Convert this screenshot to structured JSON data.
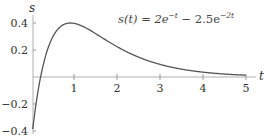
{
  "chart_data": {
    "type": "line",
    "xlabel": "t",
    "ylabel": "s",
    "xlim": [
      0,
      5.4
    ],
    "ylim": [
      -0.42,
      0.45
    ],
    "grid": false,
    "legend": null,
    "x_ticks": [
      1,
      2,
      3,
      4,
      5
    ],
    "x_tick_labels": [
      "1",
      "2",
      "3",
      "4",
      "5"
    ],
    "y_ticks": [
      -0.4,
      -0.2,
      0.2,
      0.4
    ],
    "y_tick_labels": [
      "−0.4",
      "−0.2",
      "0.2",
      "0.4"
    ],
    "series": [
      {
        "name": "s(t)",
        "formula": "2*exp(-t) - 2.5*exp(-2*t)",
        "x": [
          0.0,
          0.1,
          0.223,
          0.3,
          0.4,
          0.5,
          0.6,
          0.7,
          0.8,
          0.916,
          1.0,
          1.25,
          1.5,
          1.75,
          2.0,
          2.5,
          3.0,
          3.5,
          4.0,
          4.5,
          5.0
        ],
        "values": [
          -0.5,
          -0.237,
          0.0,
          0.109,
          0.216,
          0.294,
          0.35,
          0.387,
          0.41,
          0.4,
          0.397,
          0.368,
          0.322,
          0.272,
          0.225,
          0.148,
          0.094,
          0.059,
          0.036,
          0.022,
          0.013
        ]
      }
    ],
    "annotations": [
      {
        "text": "s(t) = 2e^{-t} - 2.5e^{-2t}",
        "position": "top-center"
      }
    ]
  },
  "labels": {
    "y_axis": "s",
    "x_axis": "t",
    "formula_prefix": "s(t) = 2e",
    "formula_exp1": "−t",
    "formula_mid": " − 2.5e",
    "formula_exp2": "−2t",
    "x_ticks": [
      "1",
      "2",
      "3",
      "4",
      "5"
    ],
    "y_ticks": [
      "0.4",
      "0.2",
      "−0.2",
      "−0.4"
    ]
  },
  "colors": {
    "curve": "#555555",
    "axis": "#aaaaaa",
    "text": "#333333"
  }
}
